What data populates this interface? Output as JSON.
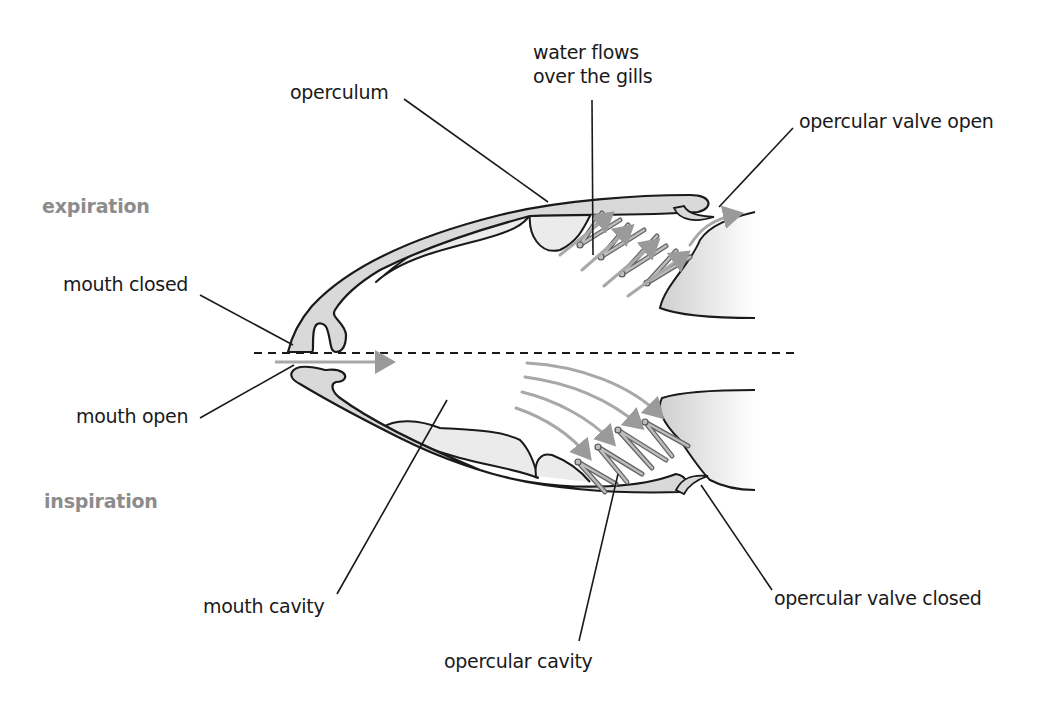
{
  "diagram": {
    "type": "fish gill ventilation cross-section",
    "phases": {
      "expiration": "expiration",
      "inspiration": "inspiration"
    },
    "labels": {
      "operculum": "operculum",
      "water_flows": "water flows\nover the gills",
      "opercular_valve_open": "opercular valve open",
      "mouth_closed": "mouth closed",
      "mouth_open": "mouth open",
      "mouth_cavity": "mouth cavity",
      "opercular_cavity": "opercular cavity",
      "opercular_valve_closed": "opercular valve closed"
    },
    "colors": {
      "outline": "#1a1a1a",
      "tissue_fill": "#d9d9d9",
      "tissue_light": "#ebebeb",
      "flow_arrow": "#9a9a9a",
      "gill_filament": "#777777",
      "phase_text": "#8c8c8c",
      "label_text": "#1a1a1a"
    }
  }
}
